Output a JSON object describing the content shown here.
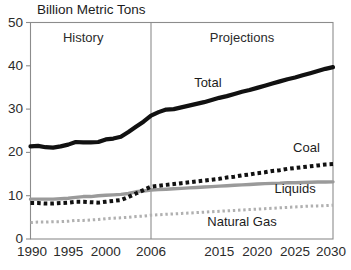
{
  "chart_data": {
    "type": "line",
    "title": "Billion Metric Tons",
    "xlabel": "",
    "ylabel": "Billion Metric Tons",
    "ylim": [
      0,
      50
    ],
    "y_ticks": [
      0,
      10,
      20,
      30,
      40,
      50
    ],
    "x_tick_labels": [
      "1990",
      "1995",
      "2000",
      "2006",
      "2015",
      "2020",
      "2025",
      "2030"
    ],
    "x_tick_values": [
      1990,
      1995,
      2000,
      2006,
      2015,
      2020,
      2025,
      2030
    ],
    "xlim": [
      1990,
      2030
    ],
    "grid": false,
    "legend_position": "inline-annotations",
    "divider_year": 2006,
    "annotations": [
      {
        "name": "history",
        "text": "History",
        "x": 1997,
        "y": 45.5
      },
      {
        "name": "projections",
        "text": "Projections",
        "x": 2018,
        "y": 45.5
      },
      {
        "name": "total",
        "text": "Total",
        "x": 2013.5,
        "y": 35.2
      },
      {
        "name": "coal",
        "text": "Coal",
        "x": 2026.5,
        "y": 20.2
      },
      {
        "name": "liquids",
        "text": "Liquids",
        "x": 2025.0,
        "y": 10.6
      },
      {
        "name": "natural-gas",
        "text": "Natural Gas",
        "x": 2018.0,
        "y": 3.1
      }
    ],
    "x": [
      1990,
      1991,
      1992,
      1993,
      1994,
      1995,
      1996,
      1997,
      1998,
      1999,
      2000,
      2001,
      2002,
      2003,
      2004,
      2005,
      2006,
      2007,
      2008,
      2009,
      2010,
      2011,
      2012,
      2013,
      2014,
      2015,
      2016,
      2017,
      2018,
      2019,
      2020,
      2021,
      2022,
      2023,
      2024,
      2025,
      2026,
      2027,
      2028,
      2029,
      2030
    ],
    "series": [
      {
        "name": "Total",
        "style": "solid",
        "color": "#111111",
        "width": 4.2,
        "values": [
          21.4,
          21.5,
          21.2,
          21.1,
          21.4,
          21.8,
          22.4,
          22.3,
          22.3,
          22.4,
          23.0,
          23.2,
          23.6,
          24.7,
          25.9,
          27.1,
          28.5,
          29.3,
          29.9,
          30.0,
          30.4,
          30.8,
          31.2,
          31.6,
          32.1,
          32.6,
          33.0,
          33.5,
          34.0,
          34.4,
          34.9,
          35.4,
          35.9,
          36.4,
          36.9,
          37.3,
          37.8,
          38.3,
          38.8,
          39.3,
          39.7
        ]
      },
      {
        "name": "Coal",
        "style": "dotted-heavy",
        "color": "#111111",
        "width": 4.0,
        "values": [
          8.3,
          8.3,
          8.2,
          8.2,
          8.3,
          8.4,
          8.6,
          8.6,
          8.5,
          8.4,
          8.6,
          8.8,
          9.0,
          9.7,
          10.5,
          11.3,
          12.1,
          12.3,
          12.5,
          12.7,
          12.9,
          13.1,
          13.3,
          13.5,
          13.7,
          13.9,
          14.2,
          14.4,
          14.7,
          14.9,
          15.2,
          15.4,
          15.7,
          15.9,
          16.2,
          16.4,
          16.6,
          16.8,
          17.0,
          17.2,
          17.3
        ]
      },
      {
        "name": "Liquids",
        "style": "solid",
        "color": "#9a9a9a",
        "width": 3.4,
        "values": [
          9.2,
          9.2,
          9.2,
          9.2,
          9.3,
          9.4,
          9.6,
          9.8,
          9.8,
          10.0,
          10.1,
          10.2,
          10.3,
          10.5,
          10.9,
          11.1,
          11.3,
          11.4,
          11.5,
          11.6,
          11.7,
          11.8,
          11.9,
          12.0,
          12.1,
          12.2,
          12.3,
          12.4,
          12.5,
          12.6,
          12.7,
          12.8,
          12.85,
          12.9,
          13.0,
          13.0,
          13.05,
          13.1,
          13.15,
          13.18,
          13.2
        ]
      },
      {
        "name": "Natural Gas",
        "style": "dotted-light",
        "color": "#b0b0b0",
        "width": 3.0,
        "values": [
          3.8,
          3.9,
          3.9,
          4.0,
          4.0,
          4.1,
          4.3,
          4.3,
          4.4,
          4.5,
          4.7,
          4.8,
          4.9,
          5.0,
          5.2,
          5.3,
          5.5,
          5.6,
          5.7,
          5.8,
          5.9,
          6.0,
          6.1,
          6.2,
          6.3,
          6.4,
          6.5,
          6.6,
          6.7,
          6.8,
          6.9,
          7.0,
          7.1,
          7.2,
          7.3,
          7.4,
          7.5,
          7.6,
          7.65,
          7.7,
          7.8
        ]
      }
    ],
    "colors": {
      "total": "#111111",
      "coal": "#111111",
      "liquids": "#9a9a9a",
      "natural_gas": "#b0b0b0",
      "frame": "#8c8c8c",
      "divider": "#8c8c8c",
      "text": "#1c1c1c"
    }
  }
}
